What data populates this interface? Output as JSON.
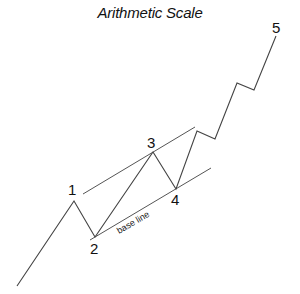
{
  "title": "Arithmetic Scale",
  "labels": {
    "w1": "1",
    "w2": "2",
    "w3": "3",
    "w4": "4",
    "w5": "5",
    "base_line": "base line"
  },
  "colors": {
    "line": "#444444",
    "text": "#111111",
    "background": "#ffffff"
  },
  "wave_points": [
    [
      17,
      286
    ],
    [
      74,
      201
    ],
    [
      95,
      237
    ],
    [
      153,
      152
    ],
    [
      176,
      189
    ],
    [
      197,
      131
    ],
    [
      215,
      139
    ],
    [
      237,
      83
    ],
    [
      254,
      90
    ],
    [
      276,
      36
    ]
  ],
  "channel": {
    "upper": [
      [
        83,
        194
      ],
      [
        195,
        127
      ]
    ],
    "lower": [
      [
        90,
        240
      ],
      [
        211,
        168
      ]
    ]
  }
}
